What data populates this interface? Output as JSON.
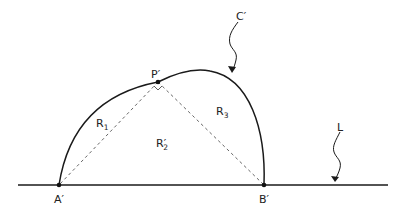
{
  "diagram": {
    "type": "geometric-figure",
    "stroke_color": "#1a1a1a",
    "background": "#ffffff",
    "labels": {
      "curve": "C′",
      "line": "L",
      "point_a": "A′",
      "point_b": "B′",
      "point_p": "P′",
      "region_1": {
        "base": "R",
        "sub": "1"
      },
      "region_2": {
        "base": "R′",
        "sub": "2"
      },
      "region_3": {
        "base": "R",
        "sub": "3"
      }
    },
    "points": {
      "A": [
        59,
        185
      ],
      "B": [
        264,
        185
      ],
      "P": [
        158,
        82
      ]
    },
    "annotations": [
      "right-angle marker at P′",
      "dashed segments P′A′ and P′B′",
      "wavy arrows pointing to C′ and L"
    ]
  }
}
